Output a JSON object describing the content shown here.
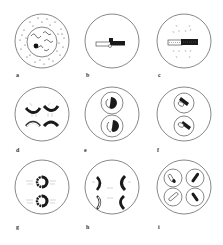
{
  "figure": {
    "line_color": "#555555",
    "chromosome_dark": "#1a1a1a",
    "chromosome_light": "#ffffff",
    "panels": [
      {
        "label": "a",
        "description": "Interphase cell with cytoplasm granules, nucleus with chromatin threads and nucleolus"
      },
      {
        "label": "b",
        "description": "Single paired chromosome (bivalent) at center"
      },
      {
        "label": "c",
        "description": "Bivalent on metaphase plate with spindle fibres"
      },
      {
        "label": "d",
        "description": "Four chromatids separating toward poles"
      },
      {
        "label": "e",
        "description": "Two daughter nuclei, each with chromosomes"
      },
      {
        "label": "f",
        "description": "Two daughter nuclei with condensed chromosomes"
      },
      {
        "label": "g",
        "description": "Second division metaphase, two chromosome rosettes"
      },
      {
        "label": "h",
        "description": "Second division anaphase, four chromatid groups"
      },
      {
        "label": "i",
        "description": "Four haploid cells, each with one chromosome"
      }
    ]
  }
}
